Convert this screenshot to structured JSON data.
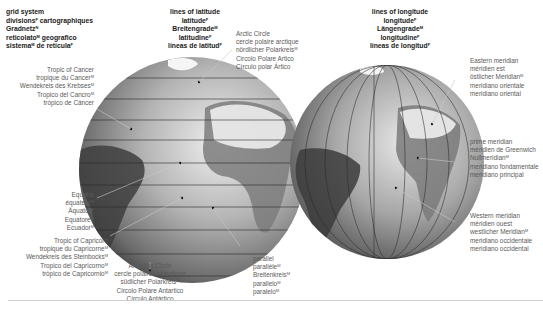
{
  "title_block": {
    "lines": [
      {
        "text": "grid system",
        "g": ""
      },
      {
        "text": "divisions",
        "g": "F",
        "rest": " cartographiques"
      },
      {
        "text": "Gradnetz",
        "g": "N",
        "rest": ""
      },
      {
        "text": "reticolato",
        "g": "M",
        "rest": " geografico"
      },
      {
        "text": "sistema",
        "g": "M",
        "rest": " de retícula",
        "g2": "F"
      }
    ]
  },
  "latitude_block": {
    "lines": [
      "lines of latitude",
      "latitude",
      "Breitengrade",
      "latitudine",
      "líneas de latitud"
    ],
    "genders": [
      "",
      "F",
      "M",
      "F",
      "F"
    ]
  },
  "longitude_block": {
    "lines": [
      "lines of longitude",
      "longitude",
      "Längengrade",
      "longitudine",
      "líneas de longitud"
    ],
    "genders": [
      "",
      "F",
      "M",
      "F",
      "F"
    ]
  },
  "labels": {
    "tropic_cancer": [
      "Tropic of Cancer",
      "tropique du Cancer",
      "Wendekreis des Krebses",
      "Tropico del Cancro",
      "trópico de Cáncer"
    ],
    "arctic_circle": [
      "Arctic Circle",
      "cercle polaire arctique",
      "nördlicher Polarkreis",
      "Circolo Polare Artico",
      "Círculo polar Ártico"
    ],
    "equator": [
      "Equator",
      "équateur",
      "Äquator",
      "Equatore",
      "Ecuador"
    ],
    "tropic_capricorn": [
      "Tropic of Capricorn",
      "tropique du Capricorne",
      "Wendekreis des Steinbocks",
      "Tropico del Capricorno",
      "trópico de Capricornio"
    ],
    "antarctic_circle": [
      "Antarctic Circle",
      "cercle polaire antarctique",
      "südlicher Polarkreis",
      "Circolo Polare Antartico",
      "Círculo Antártico"
    ],
    "parallel": [
      "parallel",
      "parallèle",
      "Breitenkreis",
      "parallelo",
      "paralelo"
    ],
    "eastern_meridian": [
      "Eastern meridian",
      "méridien est",
      "östlicher Meridian",
      "meridiano orientale",
      "meridiano oriental"
    ],
    "prime_meridian": [
      "prime meridian",
      "méridien de Greenwich",
      "Nullmeridian",
      "meridiano fondamentale",
      "meridiano principal"
    ],
    "western_meridian": [
      "Western meridian",
      "méridien ouest",
      "westlicher Meridian",
      "meridiano occidentale",
      "meridiano occidental"
    ]
  },
  "colors": {
    "globe_light": "#e6e6e6",
    "globe_mid": "#a8a8a8",
    "globe_dark": "#3c3c3c",
    "grid_line": "#2a2a2a",
    "leader_line": "#c8c8c8"
  }
}
